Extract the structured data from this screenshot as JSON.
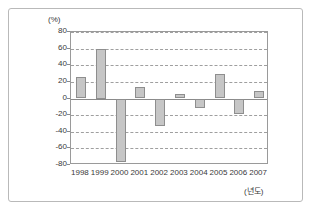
{
  "chart_data": {
    "type": "bar",
    "title": "",
    "subtitle": "",
    "xlabel": "(년도)",
    "ylabel": "(%)",
    "categories": [
      "1998",
      "1999",
      "2000",
      "2001",
      "2002",
      "2003",
      "2004",
      "2005",
      "2006",
      "2007"
    ],
    "values": [
      26,
      60,
      -76,
      14,
      -33,
      5,
      -12,
      30,
      -19,
      9
    ],
    "series": [
      {
        "name": "",
        "values": [
          26,
          60,
          -76,
          14,
          -33,
          5,
          -12,
          30,
          -19,
          9
        ]
      }
    ],
    "ylim": [
      -80,
      80
    ],
    "yticks": [
      "80",
      "60",
      "40",
      "20",
      "0",
      "-20",
      "-40",
      "-60",
      "-80"
    ],
    "ytick_values": [
      80,
      60,
      40,
      20,
      0,
      -20,
      -40,
      -60,
      -80
    ],
    "grid": true,
    "grid_style": "dashed-horizontal",
    "legend": "none",
    "bar_color": "#c6c6c6",
    "bar_edge_color": "#8e8e8e",
    "grid_color": "#9f9f9f",
    "axis_color": "#9a9a9a",
    "text_color": "#3a3a3a"
  }
}
